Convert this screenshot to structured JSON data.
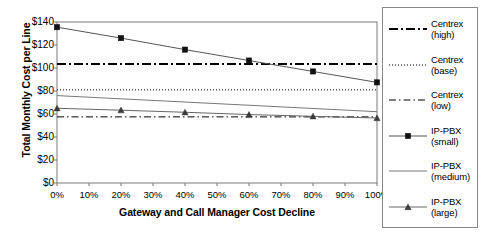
{
  "chart_data": {
    "type": "line",
    "title": "",
    "xlabel": "Gateway and Call Manager Cost Decline",
    "ylabel": "Total Monthly Cost per Line",
    "x": [
      0,
      10,
      20,
      30,
      40,
      50,
      60,
      70,
      80,
      90,
      100
    ],
    "xtick_labels": [
      "0%",
      "10%",
      "20%",
      "30%",
      "40%",
      "50%",
      "60%",
      "70%",
      "80%",
      "90%",
      "100%"
    ],
    "xlim": [
      0,
      100
    ],
    "ylim": [
      0,
      140
    ],
    "ytick_values": [
      0,
      20,
      40,
      60,
      80,
      100,
      120,
      140
    ],
    "ytick_labels": [
      "$0",
      "$20",
      "$40",
      "$60",
      "$80",
      "$100",
      "$120",
      "$140"
    ],
    "grid": false,
    "legend_position": "right",
    "series": [
      {
        "name": "Centrex (high)",
        "legend_label_line1": "Centrex",
        "legend_label_line2": "(high)",
        "style": "dash-dot",
        "marker": "none",
        "color": "#000000",
        "width": 2,
        "x": [
          0,
          100
        ],
        "values": [
          103.5,
          103.5
        ]
      },
      {
        "name": "Centrex (base)",
        "legend_label_line1": "Centrex",
        "legend_label_line2": "(base)",
        "style": "dotted",
        "marker": "none",
        "color": "#000000",
        "width": 1,
        "x": [
          0,
          100
        ],
        "values": [
          81,
          81
        ]
      },
      {
        "name": "Centrex (low)",
        "legend_label_line1": "Centrex",
        "legend_label_line2": "(low)",
        "style": "dash-dot-long",
        "marker": "none",
        "color": "#000000",
        "width": 1,
        "x": [
          0,
          100
        ],
        "values": [
          57.5,
          57.5
        ]
      },
      {
        "name": "IP-PBX (small)",
        "legend_label_line1": "IP-PBX",
        "legend_label_line2": "(small)",
        "style": "solid",
        "marker": "square",
        "color": "#555555",
        "width": 1,
        "x": [
          0,
          20,
          40,
          60,
          80,
          100
        ],
        "values": [
          135.5,
          126,
          116,
          106.5,
          97,
          87.5
        ]
      },
      {
        "name": "IP-PBX (medium)",
        "legend_label_line1": "IP-PBX",
        "legend_label_line2": "(medium)",
        "style": "solid",
        "marker": "none",
        "color": "#777777",
        "width": 1,
        "x": [
          0,
          100
        ],
        "values": [
          76,
          62
        ]
      },
      {
        "name": "IP-PBX (large)",
        "legend_label_line1": "IP-PBX",
        "legend_label_line2": "(large)",
        "style": "solid",
        "marker": "triangle",
        "color": "#666666",
        "width": 1,
        "x": [
          0,
          20,
          40,
          60,
          80,
          100
        ],
        "values": [
          65,
          63.3,
          61.5,
          59.5,
          58,
          56.5
        ]
      }
    ]
  }
}
